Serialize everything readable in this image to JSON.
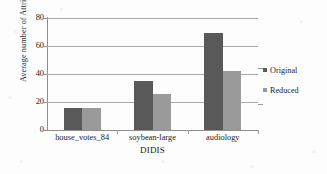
{
  "chart_data": {
    "type": "bar",
    "title": "",
    "xlabel": "DIDIS",
    "ylabel": "Average number of Attributes",
    "categories": [
      "house_votes_84",
      "soybean-large",
      "audiology"
    ],
    "series": [
      {
        "name": "Original",
        "color": "#595959",
        "values": [
          16,
          35,
          69
        ]
      },
      {
        "name": "Reduced",
        "color": "#9a9a9a",
        "values": [
          15.5,
          25.5,
          42
        ]
      }
    ],
    "ylim": [
      0,
      80
    ],
    "yticks": [
      0,
      20,
      40,
      60,
      80
    ],
    "ytick_labels": [
      "0",
      "20",
      "40",
      "60",
      "80"
    ],
    "grid": true,
    "legend_position": "right"
  },
  "legend": {
    "items": [
      {
        "label": "Original",
        "color": "#595959"
      },
      {
        "label": "Reduced",
        "color": "#9a9a9a"
      }
    ]
  },
  "colors": {
    "original": "#595959",
    "reduced": "#9a9a9a",
    "gridline": "#a9a9a9",
    "axis": "#8e8e8e",
    "text": "#232323",
    "background": "#fdfdfd"
  }
}
